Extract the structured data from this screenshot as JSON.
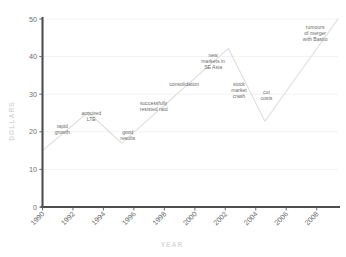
{
  "chart_data": {
    "type": "line",
    "title": "",
    "xlabel": "YEAR",
    "ylabel": "DOLLARS",
    "xlim": [
      1990,
      2009.4
    ],
    "ylim": [
      0,
      50
    ],
    "grid": true,
    "legend": "none",
    "x_ticks": [
      "1990",
      "1992",
      "1994",
      "1996",
      "1998",
      "2000",
      "2002",
      "2004",
      "2006",
      "2008"
    ],
    "x_tick_values": [
      1990,
      1992,
      1994,
      1996,
      1998,
      2000,
      2002,
      2004,
      2006,
      2008
    ],
    "y_ticks": [
      "0",
      "10",
      "20",
      "30",
      "40",
      "50"
    ],
    "y_tick_values": [
      0,
      10,
      20,
      30,
      40,
      50
    ],
    "series": [
      {
        "name": "share price",
        "color": "#dedede",
        "x": [
          1990.0,
          1993.0,
          1995.2,
          2002.2,
          2004.6,
          2009.4
        ],
        "values": [
          15.0,
          25.2,
          17.0,
          42.2,
          22.8,
          50.0
        ]
      }
    ],
    "annotations": [
      {
        "id": "rapid-growth",
        "text_lines": [
          "rapid",
          "growth"
        ],
        "x": 1991.3,
        "y": 21.0
      },
      {
        "id": "acquired-lte",
        "text_lines": [
          "acquired",
          "LTE"
        ],
        "x": 1993.2,
        "y": 24.4
      },
      {
        "id": "good-results",
        "text_lines": [
          "good",
          "results"
        ],
        "x": 1995.6,
        "y": 19.4
      },
      {
        "id": "resisted-raid",
        "text_lines": [
          "successfully",
          "resisted raid"
        ],
        "x": 1997.3,
        "y": 27.0
      },
      {
        "id": "consolidation",
        "text_lines": [
          "consolidation"
        ],
        "x": 1999.3,
        "y": 32.2
      },
      {
        "id": "new-markets-se-asia",
        "text_lines": [
          "new",
          "markets in",
          "SE Asia"
        ],
        "x": 2001.2,
        "y": 40.0
      },
      {
        "id": "stock-market-crash",
        "text_lines": [
          "stock",
          "market",
          "crash"
        ],
        "x": 2002.9,
        "y": 32.2
      },
      {
        "id": "cut-costs",
        "text_lines": [
          "cut",
          "costs"
        ],
        "x": 2004.7,
        "y": 30.0
      },
      {
        "id": "rumours-of-merger",
        "text_lines": [
          "rumours",
          "of merger",
          "with Bastio"
        ],
        "x": 2007.9,
        "y": 47.4
      }
    ]
  }
}
